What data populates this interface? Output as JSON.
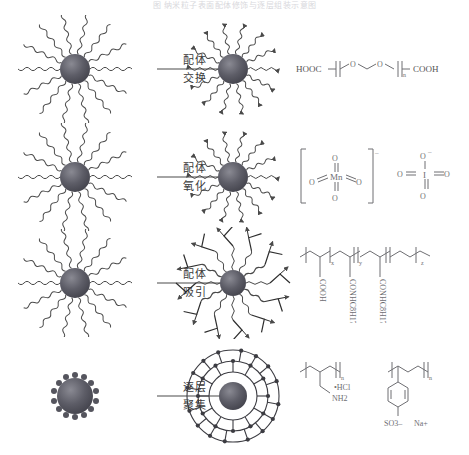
{
  "caption": {
    "text": "图 纳米粒子表面配体修饰与逐层组装示意图"
  },
  "colors": {
    "core_dark": "#4a4a52",
    "core_mid": "#6b6b74",
    "ligand": "#4a4a4a",
    "chem_stroke": "#6e6e72",
    "text": "#3a3a3a",
    "caption": "#d8d8dc"
  },
  "rows": [
    {
      "id": "ligand-exchange",
      "arrow": {
        "top_label": "配体",
        "bottom_label": "交换"
      },
      "left": {
        "name": "hydrophobic-nanoparticle",
        "core_r": 15,
        "arms": 14,
        "arm_style": "wavy"
      },
      "mid": {
        "name": "exchanged-nanoparticle",
        "core_r": 15,
        "arms": 14,
        "arm_style": "wavy-arrow"
      },
      "reagent": {
        "name": "peg-dicarboxylic-acid",
        "left_group": "HOOC",
        "right_group": "COOH",
        "repeat": "n",
        "atoms": [
          "O",
          "O"
        ],
        "label": "HOOC-(CH2CH2O)n-COOH"
      }
    },
    {
      "id": "ligand-oxidation",
      "arrow": {
        "top_label": "配体",
        "bottom_label": "氧化"
      },
      "left": {
        "name": "hydrophobic-nanoparticle",
        "core_r": 15,
        "arms": 14,
        "arm_style": "wavy"
      },
      "mid": {
        "name": "oxidized-nanoparticle",
        "core_r": 15,
        "arms": 14,
        "arm_style": "wavy-arrow"
      },
      "reagent": {
        "name": "permanganate-periodate",
        "species": [
          {
            "center": "Mn",
            "charge": "–",
            "bracketed": true,
            "oxygens": [
              "O",
              "O",
              "O",
              "O"
            ],
            "label": "[MnO4]-"
          },
          {
            "center": "I",
            "charge": "–",
            "bracketed": false,
            "oxygens": [
              "O",
              "O",
              "O",
              "O"
            ],
            "top_label": "O",
            "top_charge": "–",
            "label": "IO4-"
          }
        ]
      }
    },
    {
      "id": "ligand-attraction",
      "arrow": {
        "top_label": "配体",
        "bottom_label": "吸引"
      },
      "left": {
        "name": "hydrophobic-nanoparticle",
        "core_r": 15,
        "arms": 14,
        "arm_style": "wavy"
      },
      "mid": {
        "name": "amphiphile-coated-nanoparticle",
        "core_r": 13,
        "arms": 12,
        "arm_style": "interdigitated"
      },
      "reagent": {
        "name": "amphiphilic-polymer",
        "backbone_repeats": [
          "x",
          "y",
          "z"
        ],
        "side_groups": [
          "COOH",
          "CONHC8H17",
          "CONHC8H17"
        ],
        "label": "poly(acrylic acid-co-octylacrylamide)"
      }
    },
    {
      "id": "layer-by-layer",
      "arrow": {
        "top_label": "逐层",
        "bottom_label": "聚集"
      },
      "left": {
        "name": "bare-nanoparticle",
        "core_r": 18,
        "arms": 14,
        "arm_style": "nubs"
      },
      "mid": {
        "name": "polyelectrolyte-shell-nanoparticle",
        "core_r": 14,
        "arm_style": "cage"
      },
      "reagent": {
        "name": "polyelectrolytes",
        "species": [
          {
            "label": "PAH",
            "repeat": "n",
            "groups": [
              "•HCl",
              "NH2"
            ],
            "formula": "poly(allylamine hydrochloride)"
          },
          {
            "label": "PSS",
            "repeat": "n",
            "groups": [
              "SO3–",
              "Na+"
            ],
            "formula": "poly(sodium 4-styrenesulfonate)"
          }
        ]
      }
    }
  ]
}
